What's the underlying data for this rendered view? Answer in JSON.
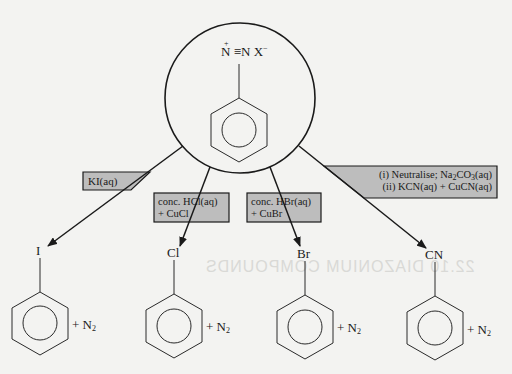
{
  "diagram": {
    "reactant": {
      "label_n1": "N",
      "label_triple": "≡",
      "label_n2": "N",
      "label_anion": "X",
      "charge_cation": "+",
      "charge_anion": "−",
      "ring": "benzene"
    },
    "reagents": [
      {
        "id": "ki",
        "line1": "KI(aq)",
        "line2": ""
      },
      {
        "id": "hcl",
        "line1": "conc. HCl(aq)",
        "line2": "+ CuCl"
      },
      {
        "id": "hbr",
        "line1": "conc. HBr(aq)",
        "line2": "+ CuBr"
      },
      {
        "id": "cn",
        "line1_a": "(i) Neutralise; Na",
        "line1_sub1": "2",
        "line1_b": "CO",
        "line1_sub2": "3",
        "line1_c": "(aq)",
        "line2": "(ii) KCN(aq) + CuCN(aq)"
      }
    ],
    "products": [
      {
        "substituent": "I",
        "byproduct": "+ N",
        "byproduct_sub": "2"
      },
      {
        "substituent": "Cl",
        "byproduct": "+ N",
        "byproduct_sub": "2"
      },
      {
        "substituent": "Br",
        "byproduct": "+ N",
        "byproduct_sub": "2"
      },
      {
        "substituent": "CN",
        "byproduct": "+ N",
        "byproduct_sub": "2"
      }
    ],
    "colors": {
      "reagent_box_fill": "#bdbdbd",
      "line": "#1a1a1a",
      "background": "#f3f3f1"
    },
    "ghost_text": "22.10  DIAZONIUM COMPOUNDS"
  }
}
